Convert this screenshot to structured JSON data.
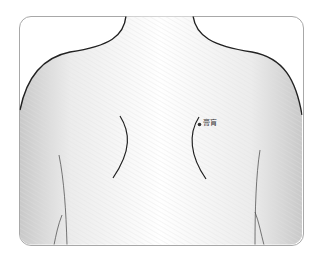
{
  "figure": {
    "type": "anatomical-acupoint-diagram",
    "view": "upper back",
    "acupoints": [
      {
        "name": "膏肓",
        "side": "right",
        "marker_color": "#333333"
      }
    ]
  },
  "colors": {
    "frame_border": "#a8a8a8",
    "outline": "#222222",
    "skin_shade": "#d9d9d9",
    "background": "#ffffff"
  }
}
